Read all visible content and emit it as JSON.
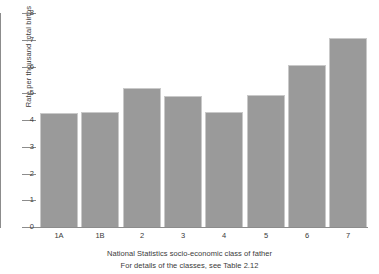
{
  "chart_data": {
    "type": "bar",
    "title": "",
    "subtitle": "",
    "xlabel": "National Statistics socio-economic class of father",
    "xlabel_note": "For details of the classes, see Table 2.12",
    "ylabel": "Rate per thousand total births",
    "ylim": [
      0,
      8
    ],
    "ytick_labels": [
      "0",
      "1",
      "2",
      "3",
      "4",
      "5",
      "6",
      "7",
      "8"
    ],
    "ytick_values": [
      0,
      1,
      2,
      3,
      4,
      5,
      6,
      7,
      8
    ],
    "grid": false,
    "legend": false,
    "categories": [
      "1A",
      "1B",
      "2",
      "3",
      "4",
      "5",
      "6",
      "7"
    ],
    "values": [
      4.25,
      4.3,
      5.2,
      4.9,
      4.3,
      4.95,
      6.05,
      7.05
    ],
    "bar_color": "#9a9a9a",
    "bar_border_color": "#c9c9c9",
    "axis_color": "#8c8c8c",
    "text_color": "#3a3a3a",
    "background": "#ffffff"
  }
}
